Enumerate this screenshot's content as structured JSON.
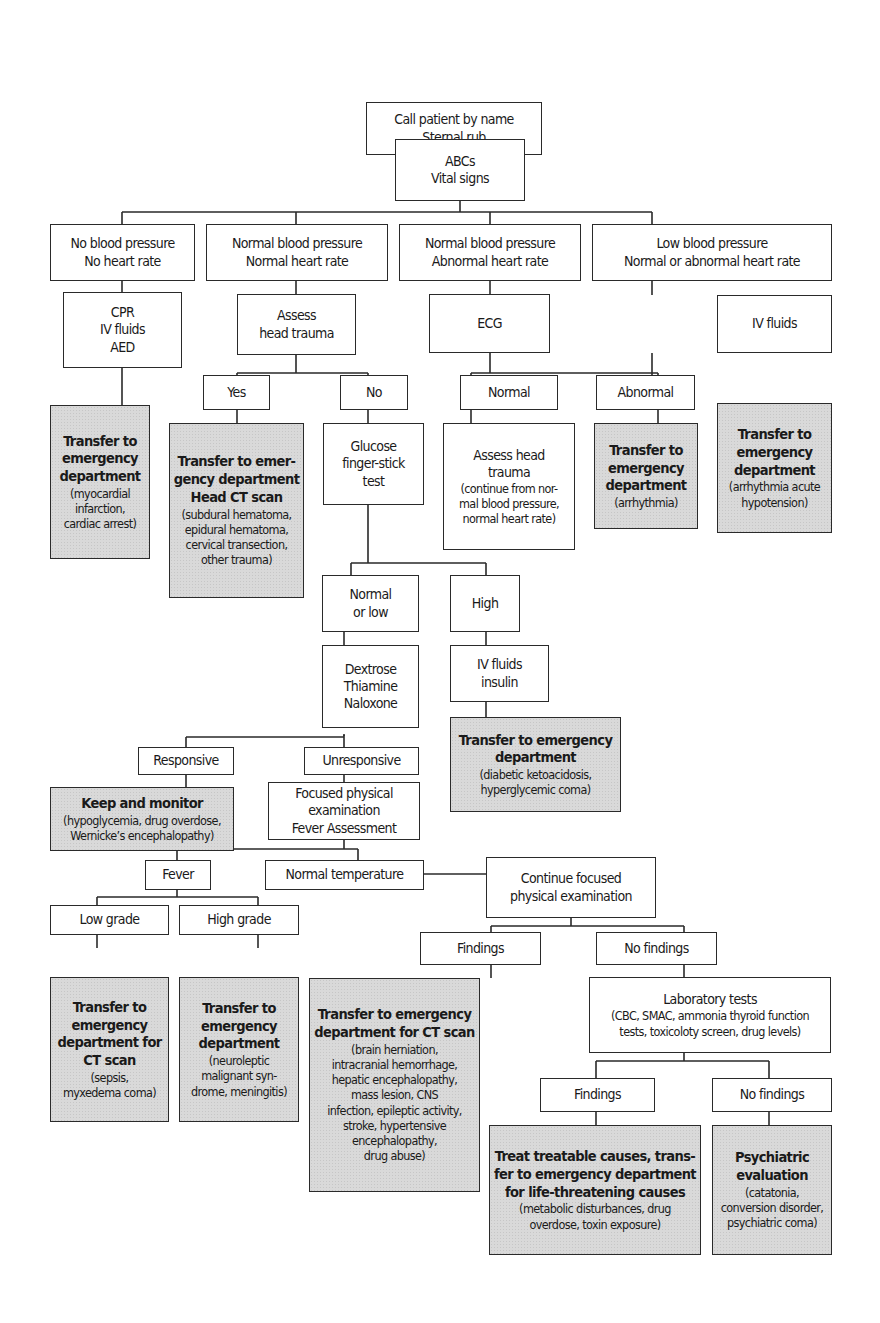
{
  "diagram": {
    "type": "clinical decision flowchart",
    "nodes": {
      "start": {
        "lines": [
          "Call patient by name",
          "Sternal rub"
        ]
      },
      "abcs": {
        "lines": [
          "ABCs",
          "Vital signs"
        ]
      },
      "no_bp": {
        "lines": [
          "No blood pressure",
          "No heart rate"
        ]
      },
      "normal_bp_normal_hr": {
        "lines": [
          "Normal blood pressure",
          "Normal heart rate"
        ]
      },
      "normal_bp_abnormal_hr": {
        "lines": [
          "Normal blood pressure",
          "Abnormal heart rate"
        ]
      },
      "low_bp": {
        "lines": [
          "Low blood pressure",
          "Normal or abnormal heart rate"
        ]
      },
      "cpr": {
        "lines": [
          "CPR",
          "IV fluids",
          "AED"
        ]
      },
      "assess_head_trauma": {
        "lines": [
          "Assess",
          "head trauma"
        ]
      },
      "ecg": {
        "lines": [
          "ECG"
        ]
      },
      "iv_fluids": {
        "lines": [
          "IV fluids"
        ]
      },
      "transfer_mi": {
        "title": [
          "Transfer to",
          "emergency",
          "department"
        ],
        "detail": [
          "(myocardial",
          "infarction,",
          "cardiac arrest)"
        ]
      },
      "yes": {
        "lines": [
          "Yes"
        ]
      },
      "no": {
        "lines": [
          "No"
        ]
      },
      "ecg_normal": {
        "lines": [
          "Normal"
        ]
      },
      "ecg_abnormal": {
        "lines": [
          "Abnormal"
        ]
      },
      "transfer_head_ct": {
        "title": [
          "Transfer to emer-",
          "gency department",
          "Head CT scan"
        ],
        "detail": [
          "(subdural hematoma,",
          "epidural hematoma,",
          "cervical transection,",
          "other trauma)"
        ]
      },
      "glucose": {
        "lines": [
          "Glucose",
          "finger-stick",
          "test"
        ]
      },
      "assess_head_trauma_2": {
        "title": [
          "Assess head",
          "trauma"
        ],
        "detail": [
          "(continue from nor-",
          "mal blood pressure,",
          "normal heart rate)"
        ]
      },
      "transfer_arrhythmia": {
        "title": [
          "Transfer to",
          "emergency",
          "department"
        ],
        "detail": [
          "(arrhythmia)"
        ]
      },
      "transfer_hypotension": {
        "title": [
          "Transfer to",
          "emergency",
          "department"
        ],
        "detail": [
          "(arrhythmia acute",
          "hypotension)"
        ]
      },
      "normal_or_low": {
        "lines": [
          "Normal",
          "or low"
        ]
      },
      "high": {
        "lines": [
          "High"
        ]
      },
      "dextrose": {
        "lines": [
          "Dextrose",
          "Thiamine",
          "Naloxone"
        ]
      },
      "iv_insulin": {
        "lines": [
          "IV fluids",
          "insulin"
        ]
      },
      "transfer_dka": {
        "title": [
          "Transfer to emergency",
          "department"
        ],
        "detail": [
          "(diabetic ketoacidosis,",
          "hyperglycemic coma)"
        ]
      },
      "responsive": {
        "lines": [
          "Responsive"
        ]
      },
      "unresponsive": {
        "lines": [
          "Unresponsive"
        ]
      },
      "keep_monitor": {
        "title": [
          "Keep and monitor"
        ],
        "detail": [
          "(hypoglycemia, drug overdose,",
          "Wernicke’s encephalopathy)"
        ]
      },
      "focused_exam": {
        "lines": [
          "Focused physical",
          "examination",
          "Fever Assessment"
        ]
      },
      "continue_exam": {
        "lines": [
          "Continue focused",
          "physical examination"
        ]
      },
      "fever": {
        "lines": [
          "Fever"
        ]
      },
      "normal_temp": {
        "lines": [
          "Normal temperature"
        ]
      },
      "findings_1": {
        "lines": [
          "Findings"
        ]
      },
      "no_findings_1": {
        "lines": [
          "No findings"
        ]
      },
      "low_grade": {
        "lines": [
          "Low grade"
        ]
      },
      "high_grade": {
        "lines": [
          "High grade"
        ]
      },
      "transfer_ct_sepsis": {
        "title": [
          "Transfer to",
          "emergency",
          "department for",
          "CT scan"
        ],
        "detail": [
          "(sepsis,",
          "myxedema coma)"
        ]
      },
      "transfer_nms": {
        "title": [
          "Transfer to",
          "emergency",
          "department"
        ],
        "detail": [
          "(neuroleptic",
          "malignant syn-",
          "drome, meningitis)"
        ]
      },
      "transfer_ct_findings": {
        "title": [
          "Transfer to emergency",
          "department for CT scan"
        ],
        "detail": [
          "(brain herniation,",
          "intracranial hemorrhage,",
          "hepatic encephalopathy,",
          "mass lesion, CNS",
          "infection, epileptic activity,",
          "stroke, hypertensive",
          "encephalopathy,",
          "drug abuse)"
        ]
      },
      "lab_tests": {
        "title": [
          "Laboratory tests"
        ],
        "detail": [
          "(CBC, SMAC, ammonia thyroid function",
          "tests, toxicoloty screen, drug levels)"
        ]
      },
      "findings_2": {
        "lines": [
          "Findings"
        ]
      },
      "no_findings_2": {
        "lines": [
          "No findings"
        ]
      },
      "treat_causes": {
        "title": [
          "Treat treatable causes, trans-",
          "fer to emergency department",
          "for life-threatening causes"
        ],
        "detail": [
          "(metabolic disturbances, drug",
          "overdose, toxin exposure)"
        ]
      },
      "psych_eval": {
        "title": [
          "Psychiatric",
          "evaluation"
        ],
        "detail": [
          "(catatonia,",
          "conversion disorder,",
          "psychiatric coma)"
        ]
      }
    },
    "colors": {
      "outcome_fill": "#d9d9d9",
      "box_fill": "#ffffff",
      "line": "#2a2a2a"
    }
  }
}
